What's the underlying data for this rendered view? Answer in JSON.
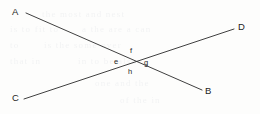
{
  "figure": {
    "background_color": "#fdfdfc",
    "stroke_color": "#2a2a2a",
    "text_color": "#1d1d1d",
    "width": 260,
    "height": 114
  },
  "vertex_labels": [
    {
      "id": "A",
      "text": "A",
      "x": 12,
      "y": 7
    },
    {
      "id": "D",
      "text": "D",
      "x": 238,
      "y": 22
    },
    {
      "id": "C",
      "text": "C",
      "x": 12,
      "y": 93
    },
    {
      "id": "B",
      "text": "B",
      "x": 205,
      "y": 86
    }
  ],
  "angle_labels": [
    {
      "id": "e",
      "text": "e",
      "x": 114,
      "y": 58
    },
    {
      "id": "f",
      "text": "f",
      "x": 130,
      "y": 47
    },
    {
      "id": "g",
      "text": "g",
      "x": 144,
      "y": 59
    },
    {
      "id": "h",
      "text": "h",
      "x": 128,
      "y": 68
    }
  ],
  "lines": [
    {
      "id": "AB",
      "from": "A",
      "to": "B",
      "x1": 26,
      "y1": 13,
      "x2": 202,
      "y2": 90
    },
    {
      "id": "CD",
      "from": "C",
      "to": "D",
      "x1": 24,
      "y1": 99,
      "x2": 234,
      "y2": 29
    }
  ],
  "intersection": {
    "x": 132,
    "y": 62
  },
  "bleed_text": [
    {
      "text": "the most and nest",
      "x": 42,
      "y": 9,
      "size": 9
    },
    {
      "text": "is to fit to",
      "x": 10,
      "y": 24,
      "size": 9
    },
    {
      "text": "a the are a can",
      "x": 82,
      "y": 24,
      "size": 9
    },
    {
      "text": "is the some over",
      "x": 44,
      "y": 40,
      "size": 9
    },
    {
      "text": "to",
      "x": 10,
      "y": 40,
      "size": 9
    },
    {
      "text": "in to be also",
      "x": 78,
      "y": 56,
      "size": 9
    },
    {
      "text": "that in",
      "x": 10,
      "y": 56,
      "size": 9
    },
    {
      "text": "one and the",
      "x": 95,
      "y": 78,
      "size": 9
    },
    {
      "text": "of the in",
      "x": 120,
      "y": 95,
      "size": 9
    }
  ]
}
